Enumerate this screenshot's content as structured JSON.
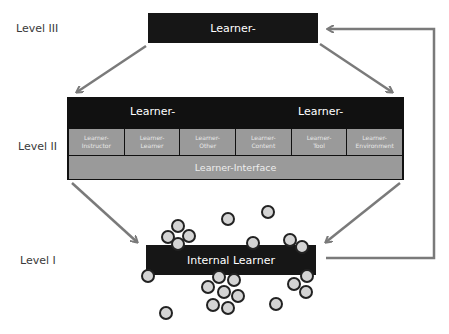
{
  "levels": {
    "level3": {
      "label": "Level III",
      "box": "Learner-"
    },
    "level2": {
      "label": "Level II",
      "headers": [
        "Learner-",
        "Learner-"
      ],
      "sub_boxes": [
        {
          "line1": "Learner-",
          "line2": "Instructor"
        },
        {
          "line1": "Learner-",
          "line2": "Learner"
        },
        {
          "line1": "Learner-",
          "line2": "Other"
        },
        {
          "line1": "Learner-",
          "line2": "Content"
        },
        {
          "line1": "Learner-",
          "line2": "Tool"
        },
        {
          "line1": "Learner-",
          "line2": "Environment"
        }
      ],
      "interface": "Learner-Interface"
    },
    "level1": {
      "label": "Level I",
      "box": "Internal Learner"
    }
  },
  "colors": {
    "dark": "#161616",
    "mid_gray": "#9a9a9a",
    "arrow": "#7a7a7a",
    "circle_fill": "#d4d4d4",
    "circle_stroke": "#222222"
  }
}
